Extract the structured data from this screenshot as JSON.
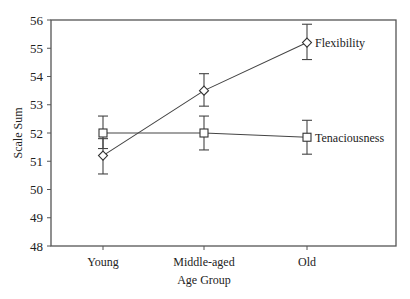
{
  "chart_data": {
    "type": "line",
    "title": "",
    "xlabel": "Age Group",
    "ylabel": "Scale Sum",
    "categories": [
      "Young",
      "Middle-aged",
      "Old"
    ],
    "ylim": [
      48,
      56
    ],
    "yticks": [
      "48",
      "49",
      "50",
      "51",
      "52",
      "53",
      "54",
      "55",
      "56"
    ],
    "grid": false,
    "legend_position": "inline-right",
    "series": [
      {
        "name": "Flexibility",
        "marker": "diamond",
        "values": [
          51.2,
          53.5,
          55.2
        ],
        "error_low": [
          50.55,
          52.95,
          54.6
        ],
        "error_high": [
          51.8,
          54.1,
          55.85
        ]
      },
      {
        "name": "Tenaciousness",
        "marker": "square",
        "values": [
          52.0,
          52.0,
          51.85
        ],
        "error_low": [
          51.45,
          51.4,
          51.25
        ],
        "error_high": [
          52.6,
          52.6,
          52.45
        ]
      }
    ]
  }
}
